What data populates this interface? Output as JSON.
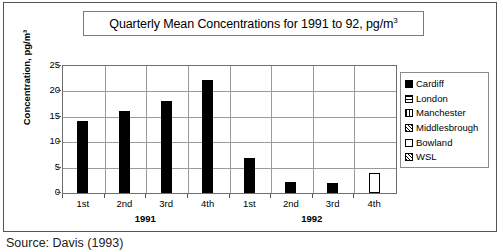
{
  "figure": {
    "title": "Quarterly Mean Concentrations for 1991 to 92, pg/m",
    "title_superscript": "3",
    "caption": "Source: Davis (1993)"
  },
  "chart_data": {
    "type": "bar",
    "xlabel": "",
    "ylabel": "Concentration, pg/m³",
    "ylim": [
      0,
      25
    ],
    "yticks": [
      "0",
      "5",
      "10",
      "15",
      "20",
      "25"
    ],
    "grid": true,
    "legend_position": "right",
    "categories": [
      "1st",
      "2nd",
      "3rd",
      "4th",
      "1st",
      "2nd",
      "3rd",
      "4th"
    ],
    "groups": [
      {
        "label": "1991",
        "categories": [
          "1st",
          "2nd",
          "3rd",
          "4th"
        ]
      },
      {
        "label": "1992",
        "categories": [
          "1st",
          "2nd",
          "3rd",
          "4th"
        ]
      }
    ],
    "values": [
      14.1,
      16.2,
      18.2,
      22.2,
      6.9,
      2.2,
      1.9,
      4.0
    ],
    "bars": [
      {
        "group": "1991",
        "quarter": "1st",
        "value": 14.1,
        "series": "Cardiff"
      },
      {
        "group": "1991",
        "quarter": "2nd",
        "value": 16.2,
        "series": "Cardiff"
      },
      {
        "group": "1991",
        "quarter": "3rd",
        "value": 18.2,
        "series": "Cardiff"
      },
      {
        "group": "1991",
        "quarter": "4th",
        "value": 22.2,
        "series": "Cardiff"
      },
      {
        "group": "1992",
        "quarter": "1st",
        "value": 6.9,
        "series": "Cardiff"
      },
      {
        "group": "1992",
        "quarter": "2nd",
        "value": 2.2,
        "series": "Cardiff"
      },
      {
        "group": "1992",
        "quarter": "3rd",
        "value": 1.9,
        "series": "Cardiff"
      },
      {
        "group": "1992",
        "quarter": "4th",
        "value": 4.0,
        "series": "Bowland"
      }
    ],
    "legend": [
      {
        "label": "Cardiff",
        "pattern": "solid"
      },
      {
        "label": "London",
        "pattern": "horizontal-lines"
      },
      {
        "label": "Manchester",
        "pattern": "vertical-lines"
      },
      {
        "label": "Middlesbrough",
        "pattern": "cross-hatch"
      },
      {
        "label": "Bowland",
        "pattern": "empty"
      },
      {
        "label": "WSL",
        "pattern": "dotted-hatch"
      }
    ],
    "colors": {
      "bar": "#000000",
      "grid": "#9b9b9b",
      "frame": "#6e6e6e",
      "background": "#ffffff"
    }
  }
}
